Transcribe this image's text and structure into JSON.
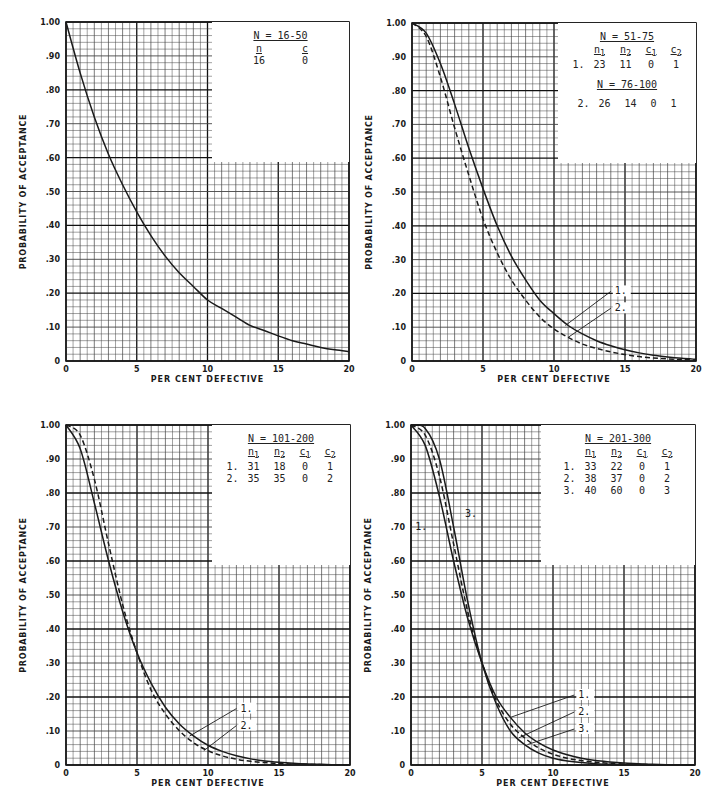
{
  "chart_data": [
    {
      "type": "line",
      "panel": "top-left",
      "xlabel": "PER CENT DEFECTIVE",
      "ylabel": "PROBABILITY OF ACCEPTANCE",
      "xlim": [
        0,
        20
      ],
      "ylim": [
        0,
        1.0
      ],
      "x_ticks": [
        "0",
        "5",
        "10",
        "15",
        "20"
      ],
      "y_ticks": [
        "0",
        ".10",
        ".20",
        ".30",
        ".40",
        ".50",
        ".60",
        ".70",
        ".80",
        ".90",
        "1.00"
      ],
      "grid": true,
      "legend": {
        "title": "N = 16-50",
        "headers": [
          "n",
          "c"
        ],
        "rows": [
          [
            "",
            "16",
            "0"
          ]
        ]
      },
      "x": [
        0,
        1,
        2,
        3,
        4,
        5,
        6,
        7,
        8,
        9,
        10,
        11,
        12,
        13,
        14,
        15,
        16,
        17,
        18,
        19,
        20
      ],
      "series": [
        {
          "name": "n=16, c=0",
          "style": "solid",
          "values": [
            1.0,
            0.85,
            0.72,
            0.61,
            0.52,
            0.44,
            0.37,
            0.31,
            0.26,
            0.22,
            0.18,
            0.155,
            0.13,
            0.105,
            0.09,
            0.074,
            0.06,
            0.05,
            0.04,
            0.033,
            0.028
          ]
        }
      ]
    },
    {
      "type": "line",
      "panel": "top-right",
      "xlabel": "PER CENT DEFECTIVE",
      "ylabel": "PROBABILITY OF ACCEPTANCE",
      "xlim": [
        0,
        20
      ],
      "ylim": [
        0,
        1.0
      ],
      "x_ticks": [
        "0",
        "5",
        "10",
        "15",
        "20"
      ],
      "y_ticks": [
        "0",
        ".10",
        ".20",
        ".30",
        ".40",
        ".50",
        ".60",
        ".70",
        ".80",
        ".90",
        "1.00"
      ],
      "grid": true,
      "legend": {
        "title": "N = 51-75",
        "title2": "N = 76-100",
        "headers": [
          "n1",
          "n2",
          "c1",
          "c2"
        ],
        "rows": [
          [
            "1.",
            "23",
            "11",
            "0",
            "1"
          ],
          [
            "2.",
            "26",
            "14",
            "0",
            "1"
          ]
        ]
      },
      "x": [
        0,
        1,
        2,
        3,
        4,
        5,
        6,
        7,
        8,
        9,
        10,
        11,
        12,
        13,
        14,
        15,
        16,
        17,
        18,
        19,
        20
      ],
      "series": [
        {
          "name": "1.",
          "style": "solid",
          "values": [
            1.0,
            0.97,
            0.88,
            0.76,
            0.63,
            0.51,
            0.4,
            0.31,
            0.24,
            0.18,
            0.14,
            0.105,
            0.08,
            0.06,
            0.045,
            0.033,
            0.024,
            0.017,
            0.012,
            0.008,
            0.005
          ]
        },
        {
          "name": "2.",
          "style": "dashed",
          "values": [
            1.0,
            0.96,
            0.84,
            0.69,
            0.55,
            0.42,
            0.32,
            0.24,
            0.18,
            0.13,
            0.095,
            0.07,
            0.05,
            0.037,
            0.027,
            0.019,
            0.013,
            0.009,
            0.006,
            0.004,
            0.003
          ]
        }
      ],
      "annotations": [
        "1.",
        "2."
      ]
    },
    {
      "type": "line",
      "panel": "bottom-left",
      "xlabel": "PER CENT DEFECTIVE",
      "ylabel": "PROBABILITY OF ACCEPTANCE",
      "xlim": [
        0,
        20
      ],
      "ylim": [
        0,
        1.0
      ],
      "x_ticks": [
        "0",
        "5",
        "10",
        "15",
        "20"
      ],
      "y_ticks": [
        "0",
        ".10",
        ".20",
        ".30",
        ".40",
        ".50",
        ".60",
        ".70",
        ".80",
        ".90",
        "1.00"
      ],
      "grid": true,
      "legend": {
        "title": "N = 101-200",
        "headers": [
          "n1",
          "n2",
          "c1",
          "c2"
        ],
        "rows": [
          [
            "1.",
            "31",
            "18",
            "0",
            "1"
          ],
          [
            "2.",
            "35",
            "35",
            "0",
            "2"
          ]
        ]
      },
      "x": [
        0,
        1,
        2,
        3,
        4,
        5,
        6,
        7,
        8,
        9,
        10,
        11,
        12,
        13,
        14,
        15,
        16,
        17,
        18,
        19,
        20
      ],
      "series": [
        {
          "name": "1.",
          "style": "solid",
          "values": [
            1.0,
            0.93,
            0.77,
            0.6,
            0.45,
            0.33,
            0.24,
            0.17,
            0.12,
            0.085,
            0.058,
            0.04,
            0.027,
            0.018,
            0.012,
            0.008,
            0.005,
            0.003,
            0.002,
            0.001,
            0.001
          ]
        },
        {
          "name": "2.",
          "style": "dashed",
          "values": [
            1.0,
            0.97,
            0.84,
            0.65,
            0.47,
            0.33,
            0.22,
            0.15,
            0.1,
            0.065,
            0.042,
            0.027,
            0.017,
            0.011,
            0.007,
            0.004,
            0.003,
            0.002,
            0.001,
            0.001,
            0.0
          ]
        }
      ],
      "annotations": [
        "1.",
        "2."
      ]
    },
    {
      "type": "line",
      "panel": "bottom-right",
      "xlabel": "PER CENT DEFECTIVE",
      "ylabel": "PROBABILITY OF ACCEPTANCE",
      "xlim": [
        0,
        20
      ],
      "ylim": [
        0,
        1.0
      ],
      "x_ticks": [
        "0",
        "5",
        "10",
        "15",
        "20"
      ],
      "y_ticks": [
        "0",
        ".10",
        ".20",
        ".30",
        ".40",
        ".50",
        ".60",
        ".70",
        ".80",
        ".90",
        "1.00"
      ],
      "grid": true,
      "legend": {
        "title": "N = 201-300",
        "headers": [
          "n1",
          "n2",
          "c1",
          "c2"
        ],
        "rows": [
          [
            "1.",
            "33",
            "22",
            "0",
            "1"
          ],
          [
            "2.",
            "38",
            "37",
            "0",
            "2"
          ],
          [
            "3.",
            "40",
            "60",
            "0",
            "3"
          ]
        ]
      },
      "x": [
        0,
        1,
        2,
        3,
        4,
        5,
        6,
        7,
        8,
        9,
        10,
        11,
        12,
        13,
        14,
        15,
        16,
        17,
        18,
        19,
        20
      ],
      "series": [
        {
          "name": "1.",
          "style": "solid",
          "values": [
            1.0,
            0.94,
            0.79,
            0.6,
            0.43,
            0.3,
            0.2,
            0.14,
            0.095,
            0.065,
            0.044,
            0.03,
            0.02,
            0.013,
            0.009,
            0.006,
            0.004,
            0.002,
            0.001,
            0.001,
            0.0
          ]
        },
        {
          "name": "2.",
          "style": "dashed",
          "values": [
            1.0,
            0.97,
            0.85,
            0.65,
            0.45,
            0.3,
            0.19,
            0.12,
            0.08,
            0.05,
            0.032,
            0.02,
            0.013,
            0.008,
            0.005,
            0.003,
            0.002,
            0.001,
            0.001,
            0.0,
            0.0
          ]
        },
        {
          "name": "3.",
          "style": "solid",
          "values": [
            1.0,
            0.99,
            0.9,
            0.7,
            0.48,
            0.3,
            0.18,
            0.1,
            0.06,
            0.035,
            0.02,
            0.012,
            0.007,
            0.004,
            0.002,
            0.001,
            0.001,
            0.0,
            0.0,
            0.0,
            0.0
          ]
        }
      ],
      "annotations": [
        "1.",
        "2.",
        "3."
      ]
    }
  ],
  "colors": {
    "ink": "#1a1a1a",
    "grid_minor": "#555555",
    "grid_major": "#111111",
    "paper": "#ffffff"
  }
}
